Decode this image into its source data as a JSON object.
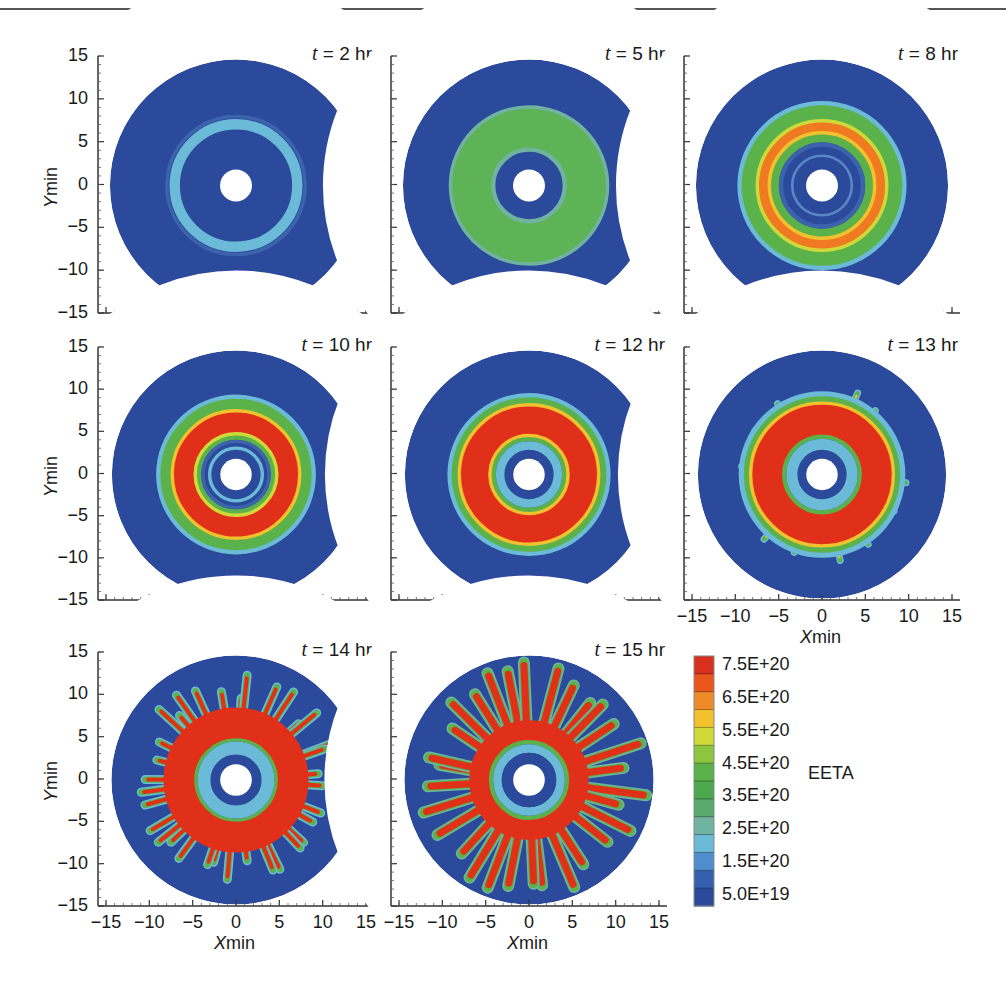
{
  "chart_data": {
    "type": "heatmap",
    "title": "",
    "xlabel": "Xmin",
    "ylabel": "Ymin",
    "xlim": [
      -15,
      15
    ],
    "ylim": [
      -15,
      15
    ],
    "x_ticks": [
      "−15",
      "−10",
      "−5",
      "0",
      "5",
      "10",
      "15"
    ],
    "y_ticks": [
      "15",
      "10",
      "5",
      "0",
      "−5",
      "−10",
      "−15"
    ],
    "panels": [
      {
        "label": "t = 2 hr",
        "t": 2,
        "pattern": "single light-blue ring at r≈7–8"
      },
      {
        "label": "t = 5 hr",
        "t": 5,
        "pattern": "green ring r≈3.5–9"
      },
      {
        "label": "t = 8 hr",
        "t": 8,
        "pattern": "green/orange/red ring r≈3.5–10"
      },
      {
        "label": "t = 10 hr",
        "t": 10,
        "pattern": "thick red ring r≈5–8 with green edges"
      },
      {
        "label": "t = 12 hr",
        "t": 12,
        "pattern": "thick red ring r≈4.5–9 with inner light-blue ring"
      },
      {
        "label": "t = 13 hr",
        "t": 13,
        "pattern": "red ring with onset of fingering"
      },
      {
        "label": "t = 14 hr",
        "t": 14,
        "pattern": "radial fingers extending to r≈12"
      },
      {
        "label": "t = 15 hr",
        "t": 15,
        "pattern": "strong radial fingering reaching domain edge"
      }
    ],
    "colorbar": {
      "title": "EETA",
      "ticks": [
        "7.5E+20",
        "6.5E+20",
        "5.5E+20",
        "4.5E+20",
        "3.5E+20",
        "2.5E+20",
        "1.5E+20",
        "5.0E+19"
      ],
      "range": [
        5e+19,
        7.5e+20
      ],
      "colors": [
        "#d7301f",
        "#e8561c",
        "#ef8a2a",
        "#f2c12e",
        "#cfd93a",
        "#8cc63f",
        "#5cb24a",
        "#4ea84e",
        "#58a96a",
        "#6fb3a0",
        "#6bbad8",
        "#4f8fcf",
        "#3560b0",
        "#2b4a9c"
      ]
    }
  },
  "panels": [
    {
      "title_var": "t",
      "title_rest": " = 2 hr"
    },
    {
      "title_var": "t",
      "title_rest": " = 5 hr"
    },
    {
      "title_var": "t",
      "title_rest": " = 8 hr"
    },
    {
      "title_var": "t",
      "title_rest": " = 10 hr"
    },
    {
      "title_var": "t",
      "title_rest": " = 12 hr"
    },
    {
      "title_var": "t",
      "title_rest": " = 13 hr"
    },
    {
      "title_var": "t",
      "title_rest": " = 14 hr"
    },
    {
      "title_var": "t",
      "title_rest": " = 15 hr"
    }
  ],
  "axes": {
    "y_ticks": [
      "15",
      "10",
      "5",
      "0",
      "−5",
      "−10",
      "−15"
    ],
    "x_ticks": [
      "−15",
      "−10",
      "−5",
      "0",
      "5",
      "10",
      "15"
    ],
    "ylabel_var": "Y",
    "ylabel_rest": "min",
    "xlabel_var": "X",
    "xlabel_rest": "min"
  },
  "colorbar": {
    "title": "EETA",
    "labels": [
      "7.5E+20",
      "6.5E+20",
      "5.5E+20",
      "4.5E+20",
      "3.5E+20",
      "2.5E+20",
      "1.5E+20",
      "5.0E+19"
    ]
  },
  "colors": {
    "dark_blue": "#2b4a9c",
    "light_blue": "#6bbad8",
    "green": "#5cb24a",
    "yellow": "#f2c12e",
    "orange": "#ef7a22",
    "red": "#e0301a"
  }
}
